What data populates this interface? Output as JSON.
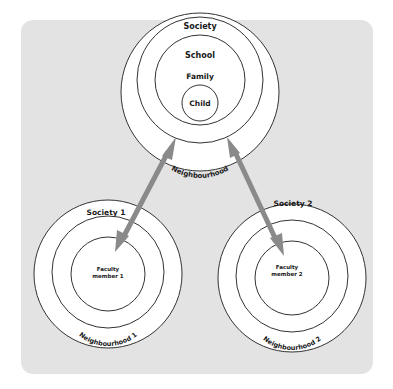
{
  "diagram": {
    "top": {
      "rings": [
        "Society",
        "School",
        "Family",
        "Child"
      ],
      "arc_label": "Neighbourhood"
    },
    "left": {
      "outer": "Society 1",
      "arc_label": "Neighbourhood 1",
      "center": [
        "Faculty",
        "member 1"
      ]
    },
    "right": {
      "outer": "Society 2",
      "arc_label": "Neighbourhood 2",
      "center": [
        "Faculty",
        "member 2"
      ]
    },
    "colors": {
      "panel": "#e3e3e3",
      "ring_fill": "#ffffff",
      "ring_stroke": "#333333",
      "arrow": "#8a8a8a"
    }
  }
}
